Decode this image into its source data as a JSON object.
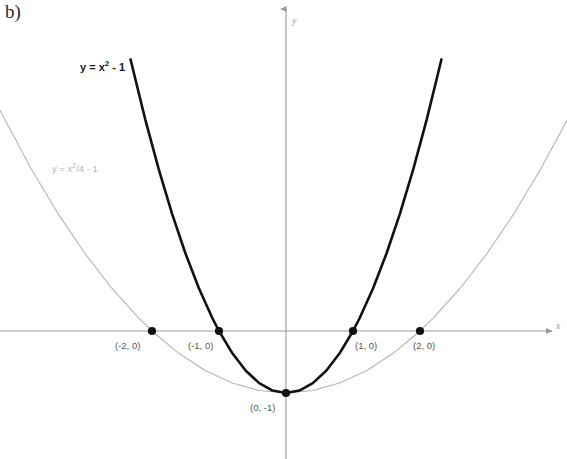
{
  "figure": {
    "part_label": "b)",
    "background_color": "#ffffff"
  },
  "axes": {
    "x_axis_label": "x",
    "y_axis_label": "y",
    "axis_color": "#9a9a9a",
    "origin_px": [
      286,
      331
    ],
    "unit_px": [
      67,
      62
    ]
  },
  "annotations": {
    "black_curve_equation_prefix": "y = x",
    "black_curve_equation_exponent": "2",
    "black_curve_equation_suffix": " - 1",
    "gray_curve_equation_prefix": "y = x",
    "gray_curve_equation_exponent": "2",
    "gray_curve_equation_suffix": "/4 - 1"
  },
  "point_labels": {
    "p_neg2": "(-2, 0)",
    "p_neg1": "(-1, 0)",
    "p_vertex": "(0, -1)",
    "p_pos1": "(1, 0)",
    "p_pos2": "(2, 0)"
  },
  "chart_data": {
    "type": "line",
    "title": "b)",
    "xlabel": "x",
    "ylabel": "y",
    "grid": false,
    "legend": "inline-curve-labels",
    "xlim": [
      -4.27,
      4.19
    ],
    "ylim": [
      -2.06,
      5.34
    ],
    "axis_color": "#9a9a9a",
    "series": [
      {
        "name": "y = x² - 1",
        "equation": "y = x^2 - 1",
        "color": "#111111",
        "line_width": 2.6,
        "vertex": [
          0,
          -1
        ],
        "roots": [
          -1,
          1
        ],
        "x": [
          -2.32,
          -2.1,
          -1.9,
          -1.7,
          -1.5,
          -1.3,
          -1.1,
          -1.0,
          -0.8,
          -0.6,
          -0.4,
          -0.2,
          0,
          0.2,
          0.4,
          0.6,
          0.8,
          1.0,
          1.1,
          1.3,
          1.5,
          1.7,
          1.9,
          2.1,
          2.32
        ],
        "y": [
          4.38,
          3.41,
          2.61,
          1.89,
          1.25,
          0.69,
          0.21,
          0,
          -0.36,
          -0.64,
          -0.84,
          -0.96,
          -1,
          -0.96,
          -0.84,
          -0.64,
          -0.36,
          0,
          0.21,
          0.69,
          1.25,
          1.89,
          2.61,
          3.41,
          4.38
        ]
      },
      {
        "name": "y = x²/4 - 1",
        "equation": "y = x^2/4 - 1",
        "color": "#b4b4b4",
        "line_width": 1.1,
        "vertex": [
          0,
          -1
        ],
        "roots": [
          -2,
          2
        ],
        "x": [
          -4.27,
          -3.8,
          -3.4,
          -3.0,
          -2.6,
          -2.2,
          -2.0,
          -1.6,
          -1.2,
          -0.8,
          -0.4,
          0,
          0.4,
          0.8,
          1.2,
          1.6,
          2.0,
          2.2,
          2.6,
          3.0,
          3.4,
          3.8,
          4.19
        ],
        "y": [
          3.56,
          2.61,
          1.89,
          1.25,
          0.69,
          0.21,
          0,
          -0.36,
          -0.64,
          -0.84,
          -0.96,
          -1,
          -0.96,
          -0.84,
          -0.64,
          -0.36,
          0,
          0.21,
          0.69,
          1.25,
          1.89,
          2.61,
          3.39
        ]
      }
    ],
    "marked_points": [
      {
        "label": "(-2, 0)",
        "x": -2,
        "y": 0
      },
      {
        "label": "(-1, 0)",
        "x": -1,
        "y": 0
      },
      {
        "label": "(0, -1)",
        "x": 0,
        "y": -1
      },
      {
        "label": "(1, 0)",
        "x": 1,
        "y": 0
      },
      {
        "label": "(2, 0)",
        "x": 2,
        "y": 0
      }
    ]
  }
}
